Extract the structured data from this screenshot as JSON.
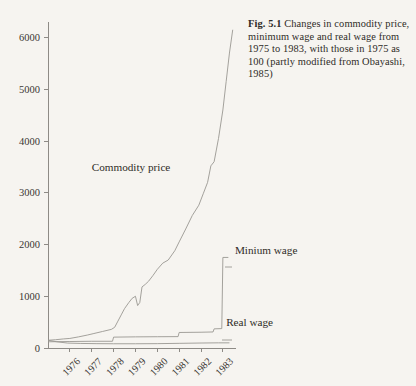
{
  "figure": {
    "number_label": "Fig. 5.1",
    "caption_text": " Changes in commodity price, minimum wage and real wage from 1975 to 1983, with those in 1975 as 100 (partly modified from Obayashi, 1985)"
  },
  "chart_data": {
    "type": "line",
    "title": "",
    "xlabel": "",
    "ylabel": "",
    "xlim": [
      1975,
      1983.6
    ],
    "ylim": [
      0,
      6300
    ],
    "grid": false,
    "legend_position": "inline-annotations",
    "yticks": [
      0,
      1000,
      2000,
      3000,
      4000,
      5000,
      6000
    ],
    "ytick_labels": [
      "0",
      "1000",
      "2000",
      "3000",
      "4000",
      "5000",
      "6000"
    ],
    "xticks": [
      1976,
      1977,
      1978,
      1979,
      1980,
      1981,
      1982,
      1983
    ],
    "xtick_labels": [
      "1976",
      "1977",
      "1978",
      "1979",
      "1980",
      "1981",
      "1982",
      "1983"
    ],
    "series": [
      {
        "name": "Commodity price",
        "label": "Commodity price",
        "x": [
          1975.0,
          1975.35,
          1975.7,
          1976.0,
          1976.4,
          1976.8,
          1977.1,
          1977.5,
          1977.9,
          1978.05,
          1978.2,
          1978.35,
          1978.5,
          1978.7,
          1978.85,
          1979.0,
          1979.1,
          1979.2,
          1979.3,
          1979.45,
          1979.6,
          1979.8,
          1980.0,
          1980.25,
          1980.5,
          1980.8,
          1981.0,
          1981.3,
          1981.6,
          1981.9,
          1982.1,
          1982.3,
          1982.45,
          1982.6,
          1982.8,
          1983.0,
          1983.15,
          1983.3,
          1983.45
        ],
        "y": [
          150,
          160,
          175,
          185,
          215,
          250,
          280,
          320,
          360,
          400,
          520,
          640,
          760,
          880,
          960,
          1000,
          820,
          880,
          1180,
          1230,
          1290,
          1400,
          1520,
          1640,
          1700,
          1880,
          2050,
          2300,
          2560,
          2760,
          2980,
          3200,
          3520,
          3600,
          4050,
          4600,
          5150,
          5700,
          6150
        ]
      },
      {
        "name": "Minium wage",
        "label": "Minium wage",
        "x": [
          1975.0,
          1976.0,
          1977.0,
          1977.95,
          1978.0,
          1979.0,
          1980.0,
          1980.95,
          1981.0,
          1982.0,
          1982.55,
          1982.6,
          1982.95,
          1983.0,
          1983.25
        ],
        "y": [
          120,
          125,
          130,
          130,
          210,
          215,
          218,
          220,
          300,
          305,
          310,
          370,
          375,
          1750,
          1750
        ]
      },
      {
        "name": "Real wage",
        "label": "Real wage",
        "x": [
          1975.0,
          1975.4,
          1975.9,
          1976.5,
          1977.2,
          1978.0,
          1979.0,
          1980.0,
          1981.0,
          1982.0,
          1982.8,
          1983.3
        ],
        "y": [
          150,
          120,
          95,
          88,
          84,
          82,
          82,
          84,
          90,
          96,
          100,
          100
        ]
      }
    ],
    "annotations": [
      {
        "text": "Commodity price",
        "x": 1977.0,
        "y": 3430
      },
      {
        "text": "Minium wage",
        "x": 1983.55,
        "y": 1810
      },
      {
        "text": "Real wage",
        "x": 1983.15,
        "y": 430
      }
    ]
  },
  "colors": {
    "background": "#f6f4f0",
    "axis": "#8e8b86",
    "line": "#9a9792",
    "text": "#3a3733"
  }
}
